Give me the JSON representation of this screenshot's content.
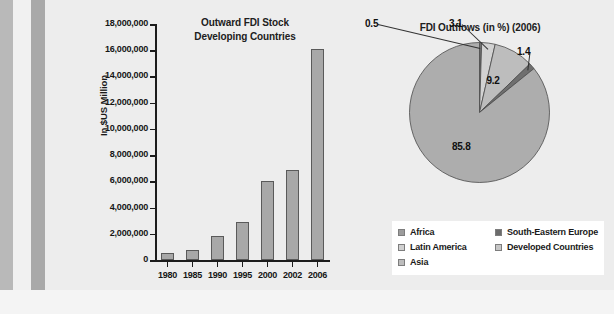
{
  "chart_data": [
    {
      "type": "bar",
      "title": "Outward FDI Stock\nDeveloping Countries",
      "title_line1": "Outward FDI Stock",
      "title_line2": "Developing Countries",
      "xlabel": "",
      "ylabel": "In $US Million",
      "categories": [
        "1980",
        "1985",
        "1990",
        "1995",
        "2000",
        "2002",
        "2006"
      ],
      "values": [
        500000,
        750000,
        1800000,
        2900000,
        6000000,
        6900000,
        16100000
      ],
      "ylim": [
        0,
        18000000
      ],
      "ytick_labels": [
        "18,000,000",
        "16,000,000",
        "14,000,000",
        "12,000,000",
        "10,000,000",
        "8,000,000",
        "6,000,000",
        "4,000,000",
        "2,000,000",
        "0"
      ],
      "ytick_values": [
        18000000,
        16000000,
        14000000,
        12000000,
        10000000,
        8000000,
        6000000,
        4000000,
        2000000,
        0
      ],
      "grid": false,
      "legend": false,
      "bar_color": "#a8a8a8",
      "bar_edge_color": "#5a5a5a"
    },
    {
      "type": "pie",
      "title": "FDI Outflows (in %) (2006)",
      "labels": [
        "Africa",
        "Latin America",
        "Asia",
        "South-Eastern Europe",
        "Developed Countries"
      ],
      "values": [
        0.5,
        3.1,
        9.2,
        1.4,
        85.8
      ],
      "value_labels": [
        "0.5",
        "3.1",
        "9.2",
        "1.4",
        "85.8"
      ],
      "colors": [
        "#6f6f6f",
        "#d2d2d2",
        "#bdbdbd",
        "#6f6f6f",
        "#adadad"
      ],
      "legend": true,
      "legend_position": "bottom",
      "legend_columns": 2,
      "legend_left": [
        {
          "label": "Africa",
          "color": "#9c9c9c"
        },
        {
          "label": "Latin America",
          "color": "#d0d0d0"
        },
        {
          "label": "Asia",
          "color": "#bdbdbd"
        }
      ],
      "legend_right": [
        {
          "label": "South-Eastern Europe",
          "color": "#6b6b6b"
        },
        {
          "label": "Developed Countries",
          "color": "#c6c6c6"
        }
      ]
    }
  ]
}
